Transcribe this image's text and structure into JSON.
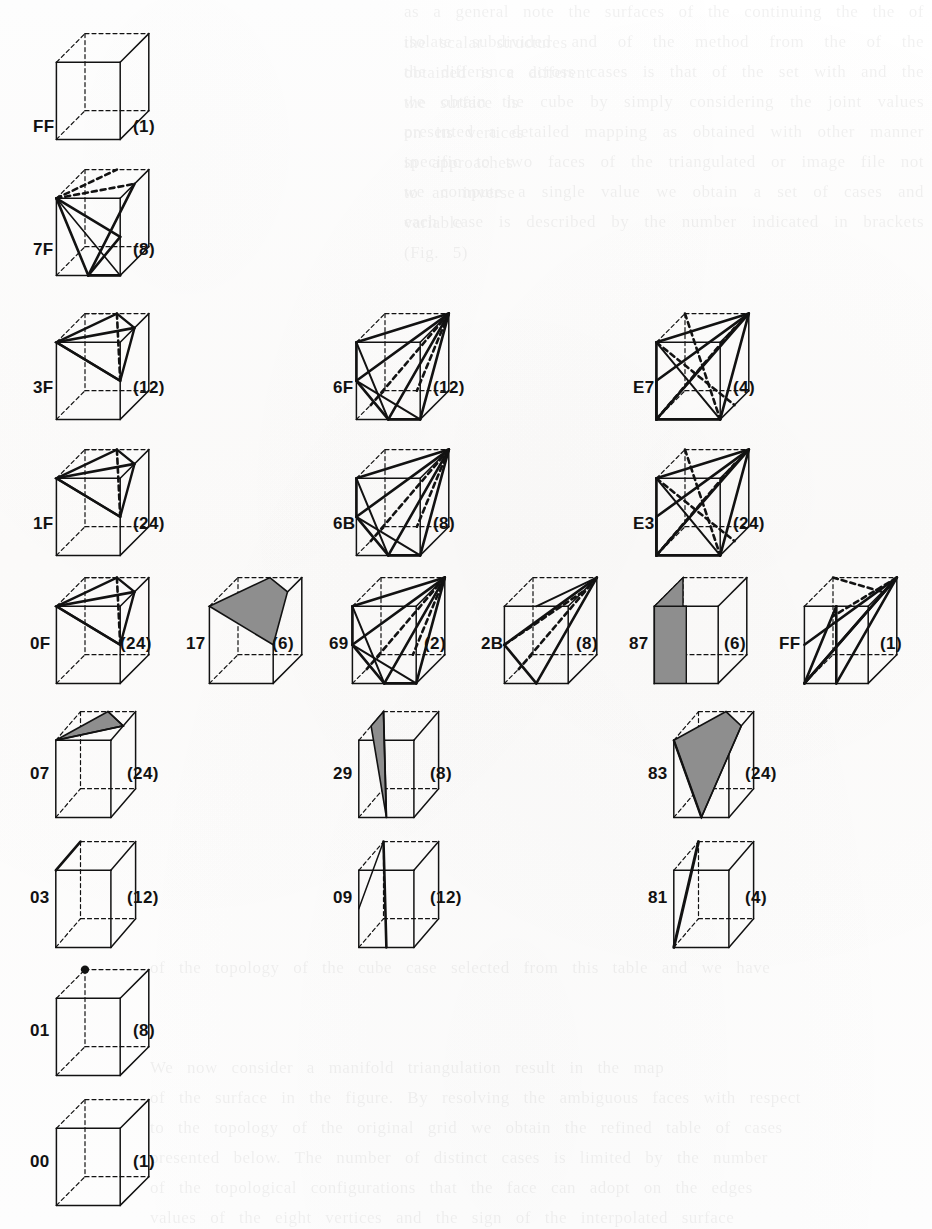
{
  "figure": {
    "kind": "marching-cubes-case-table",
    "background_color": "#fdfdfc",
    "ink_color": "#121212",
    "shade_color": "#8e8e8e",
    "cases": [
      {
        "id": "case-FF-top",
        "code": "FF",
        "count": "(1)",
        "x": 52,
        "y": 16,
        "w": 110,
        "h": 130,
        "style": "plain",
        "label_x": 33,
        "label_y": 117,
        "count_x": 133,
        "count_y": 117
      },
      {
        "id": "case-7F",
        "code": "7F",
        "count": "(8)",
        "x": 52,
        "y": 152,
        "w": 110,
        "h": 130,
        "style": "web",
        "label_x": 33,
        "label_y": 240,
        "count_x": 133,
        "count_y": 240
      },
      {
        "id": "case-3F",
        "code": "3F",
        "count": "(12)",
        "x": 52,
        "y": 296,
        "w": 110,
        "h": 130,
        "style": "band",
        "label_x": 33,
        "label_y": 378,
        "count_x": 133,
        "count_y": 378
      },
      {
        "id": "case-6F",
        "code": "6F",
        "count": "(12)",
        "x": 352,
        "y": 296,
        "w": 110,
        "h": 130,
        "style": "fan",
        "label_x": 333,
        "label_y": 378,
        "count_x": 433,
        "count_y": 378
      },
      {
        "id": "case-E7",
        "code": "E7",
        "count": "(4)",
        "x": 652,
        "y": 296,
        "w": 110,
        "h": 130,
        "style": "star",
        "label_x": 633,
        "label_y": 378,
        "count_x": 733,
        "count_y": 378
      },
      {
        "id": "case-1F",
        "code": "1F",
        "count": "(24)",
        "x": 52,
        "y": 432,
        "w": 110,
        "h": 130,
        "style": "band",
        "label_x": 33,
        "label_y": 514,
        "count_x": 133,
        "count_y": 514
      },
      {
        "id": "case-6B",
        "code": "6B",
        "count": "(8)",
        "x": 352,
        "y": 432,
        "w": 110,
        "h": 130,
        "style": "fan",
        "label_x": 333,
        "label_y": 514,
        "count_x": 433,
        "count_y": 514
      },
      {
        "id": "case-E3",
        "code": "E3",
        "count": "(24)",
        "x": 652,
        "y": 432,
        "w": 110,
        "h": 130,
        "style": "star",
        "label_x": 633,
        "label_y": 514,
        "count_x": 733,
        "count_y": 514
      },
      {
        "id": "case-0F",
        "code": "0F",
        "count": "(24)",
        "x": 52,
        "y": 560,
        "w": 110,
        "h": 130,
        "style": "band",
        "label_x": 30,
        "label_y": 634,
        "count_x": 120,
        "count_y": 634
      },
      {
        "id": "case-17",
        "code": "17",
        "count": "(6)",
        "x": 205,
        "y": 560,
        "w": 110,
        "h": 130,
        "style": "shadeband",
        "label_x": 186,
        "label_y": 634,
        "count_x": 272,
        "count_y": 634
      },
      {
        "id": "case-69",
        "code": "69",
        "count": "(2)",
        "x": 348,
        "y": 560,
        "w": 110,
        "h": 130,
        "style": "fan",
        "label_x": 329,
        "label_y": 634,
        "count_x": 424,
        "count_y": 634
      },
      {
        "id": "case-2B",
        "code": "2B",
        "count": "(8)",
        "x": 500,
        "y": 560,
        "w": 110,
        "h": 130,
        "style": "wedge",
        "label_x": 481,
        "label_y": 634,
        "count_x": 576,
        "count_y": 634
      },
      {
        "id": "case-87",
        "code": "87",
        "count": "(6)",
        "x": 650,
        "y": 560,
        "w": 110,
        "h": 130,
        "style": "shadeslab",
        "label_x": 629,
        "label_y": 634,
        "count_x": 724,
        "count_y": 634
      },
      {
        "id": "case-FF-row",
        "code": "FF",
        "count": "(1)",
        "x": 800,
        "y": 560,
        "w": 110,
        "h": 130,
        "style": "spindle",
        "label_x": 779,
        "label_y": 634,
        "count_x": 880,
        "count_y": 634
      },
      {
        "id": "case-07",
        "code": "07",
        "count": "(24)",
        "x": 52,
        "y": 694,
        "w": 95,
        "h": 130,
        "style": "shadetri",
        "label_x": 30,
        "label_y": 764,
        "count_x": 127,
        "count_y": 764
      },
      {
        "id": "case-29",
        "code": "29",
        "count": "(8)",
        "x": 355,
        "y": 694,
        "w": 95,
        "h": 130,
        "style": "shadetri2",
        "label_x": 333,
        "label_y": 764,
        "count_x": 430,
        "count_y": 764
      },
      {
        "id": "case-83",
        "code": "83",
        "count": "(24)",
        "x": 670,
        "y": 694,
        "w": 95,
        "h": 130,
        "style": "shadekite",
        "label_x": 648,
        "label_y": 764,
        "count_x": 745,
        "count_y": 764
      },
      {
        "id": "case-03",
        "code": "03",
        "count": "(12)",
        "x": 52,
        "y": 824,
        "w": 95,
        "h": 130,
        "style": "edge",
        "label_x": 30,
        "label_y": 888,
        "count_x": 127,
        "count_y": 888
      },
      {
        "id": "case-09",
        "code": "09",
        "count": "(12)",
        "x": 355,
        "y": 824,
        "w": 95,
        "h": 130,
        "style": "edge2",
        "label_x": 333,
        "label_y": 888,
        "count_x": 430,
        "count_y": 888
      },
      {
        "id": "case-81",
        "code": "81",
        "count": "(4)",
        "x": 670,
        "y": 824,
        "w": 95,
        "h": 130,
        "style": "edge3",
        "label_x": 648,
        "label_y": 888,
        "count_x": 745,
        "count_y": 888
      },
      {
        "id": "case-01",
        "code": "01",
        "count": "(8)",
        "x": 52,
        "y": 952,
        "w": 110,
        "h": 130,
        "style": "dot",
        "label_x": 30,
        "label_y": 1021,
        "count_x": 133,
        "count_y": 1021
      },
      {
        "id": "case-00",
        "code": "00",
        "count": "(1)",
        "x": 52,
        "y": 1082,
        "w": 110,
        "h": 130,
        "style": "plain",
        "label_x": 30,
        "label_y": 1152,
        "count_x": 133,
        "count_y": 1152
      }
    ],
    "ghost_text": [
      {
        "x": 404,
        "y": -4,
        "w": 520,
        "text": "as a general note the surfaces of the continuing the the of the scalar structures"
      },
      {
        "x": 404,
        "y": 26,
        "w": 520,
        "text": "isolate subdivided and of the method from the of the obtained is a different"
      },
      {
        "x": 404,
        "y": 56,
        "w": 520,
        "text": "the difference across cases is that of the set with and the the surface is"
      },
      {
        "x": 404,
        "y": 86,
        "w": 520,
        "text": "we obtain the cube by simply considering the joint values on its vertices"
      },
      {
        "x": 404,
        "y": 116,
        "w": 520,
        "text": "presented a detailed mapping as obtained with other manner in approaches"
      },
      {
        "x": 404,
        "y": 146,
        "w": 520,
        "text": "specific to two faces of the triangulated or image file not to an inverse"
      },
      {
        "x": 404,
        "y": 176,
        "w": 520,
        "text": "we compute a single value we obtain a set of cases and variable"
      },
      {
        "x": 404,
        "y": 206,
        "w": 520,
        "text": "each case is described by the number indicated in brackets (Fig. 5)"
      },
      {
        "x": 150,
        "y": 952,
        "w": 760,
        "text": "of the topology of the cube case selected from this table and we have"
      },
      {
        "x": 150,
        "y": 1052,
        "w": 760,
        "text": "We now consider a manifold triangulation result in the map"
      },
      {
        "x": 150,
        "y": 1082,
        "w": 760,
        "text": "of the surface in the figure. By resolving the ambiguous faces with respect"
      },
      {
        "x": 150,
        "y": 1112,
        "w": 760,
        "text": "to the topology of the original grid we obtain the refined table of cases"
      },
      {
        "x": 150,
        "y": 1142,
        "w": 760,
        "text": "presented below. The number of distinct cases is limited by the number"
      },
      {
        "x": 150,
        "y": 1172,
        "w": 760,
        "text": "of the topological configurations that the face can adopt on the edges"
      },
      {
        "x": 150,
        "y": 1202,
        "w": 760,
        "text": "values of the eight vertices and the sign of the interpolated surface"
      }
    ]
  }
}
